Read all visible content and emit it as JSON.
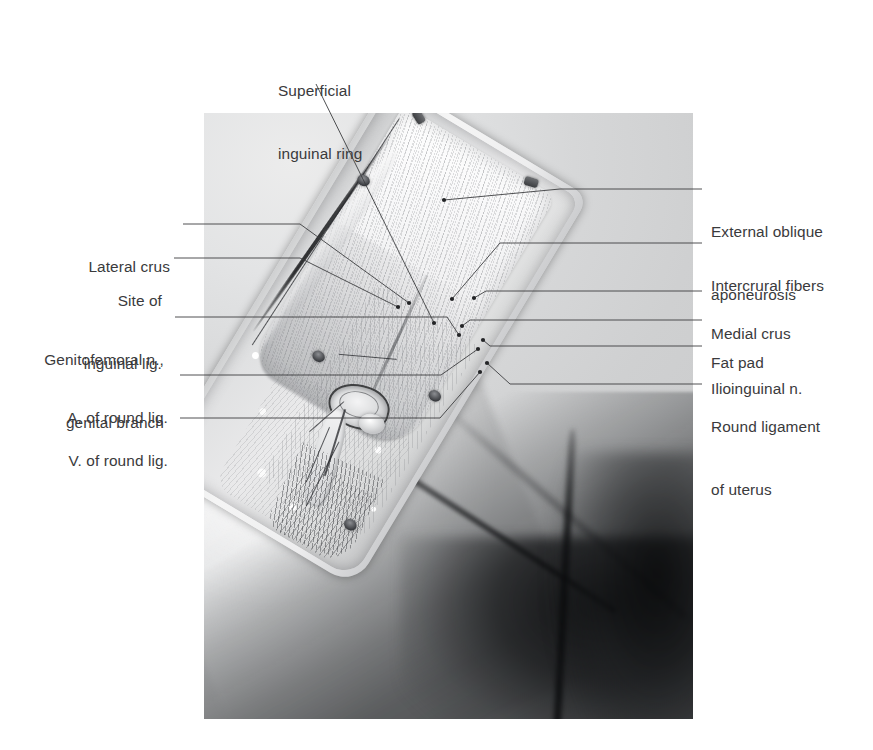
{
  "figure": {
    "title_label": "Superficial\ninguinal ring",
    "text_color": "#3a3a3c",
    "leader_color": "#3c3d3f"
  },
  "labels_top": [
    {
      "id": "superficial-inguinal-ring",
      "line1": "Superficial",
      "line2": "inguinal ring",
      "x": 278,
      "y": 36,
      "align": "left"
    }
  ],
  "labels_left": [
    {
      "id": "lateral-crus",
      "line1": "Lateral crus",
      "line2": "",
      "x": 88,
      "y": 218
    },
    {
      "id": "site-of-inguinal-lig",
      "line1": "Site of",
      "line2": "inguinal lig.",
      "x": 80,
      "y": 252
    },
    {
      "id": "genitofemoral-n-genital-branch",
      "line1": "Genitofemoral n.,",
      "line2": "genital branch",
      "x": 38,
      "y": 311
    },
    {
      "id": "a-of-round-lig",
      "line1": "A. of round lig.",
      "line2": "",
      "x": 64,
      "y": 369
    },
    {
      "id": "v-of-round-lig",
      "line1": "V. of round lig.",
      "line2": "",
      "x": 64,
      "y": 412
    }
  ],
  "labels_right": [
    {
      "id": "external-oblique-aponeurosis",
      "line1": "External oblique",
      "line2": "aponeurosis",
      "x": 711,
      "y": 179
    },
    {
      "id": "intercrural-fibers",
      "line1": "Intercrural fibers",
      "line2": "",
      "x": 711,
      "y": 234
    },
    {
      "id": "medial-crus",
      "line1": "Medial crus",
      "line2": "",
      "x": 711,
      "y": 281
    },
    {
      "id": "fat-pad",
      "line1": "Fat pad",
      "line2": "",
      "x": 711,
      "y": 310
    },
    {
      "id": "ilioinguinal-n",
      "line1": "Ilioinguinal n.",
      "line2": "",
      "x": 711,
      "y": 337
    },
    {
      "id": "round-ligament-of-uterus",
      "line1": "Round ligament",
      "line2": "of uterus",
      "x": 711,
      "y": 376
    }
  ],
  "photo": {
    "left": 204,
    "top": 113,
    "width": 489,
    "height": 606
  }
}
